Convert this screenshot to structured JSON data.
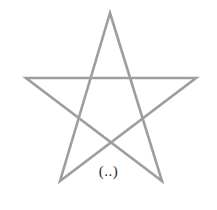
{
  "figure": {
    "name": "pentagram-figure",
    "background_color": "#ffffff",
    "width": 217,
    "height": 210,
    "caption": {
      "text": "(..)",
      "color": "#2b2b2b",
      "font_size_px": 15,
      "center_x": 109,
      "top_y": 164
    },
    "star": {
      "description": "five-pointed star (pentagram) drawn as one continuous stroke",
      "stroke_color": "#9e9e9e",
      "stroke_width_px": 2.6,
      "closed": true,
      "points": [
        {
          "name": "top-apex",
          "x": 110,
          "y": 13
        },
        {
          "name": "bottom-right-leg",
          "x": 162,
          "y": 181
        },
        {
          "name": "left-arm",
          "x": 26,
          "y": 78
        },
        {
          "name": "right-arm",
          "x": 196,
          "y": 78
        },
        {
          "name": "bottom-left-leg",
          "x": 60,
          "y": 181
        }
      ],
      "path_d": "M 110 13 L 162 181 L 26 78 L 196 78 L 60 181 Z"
    }
  }
}
